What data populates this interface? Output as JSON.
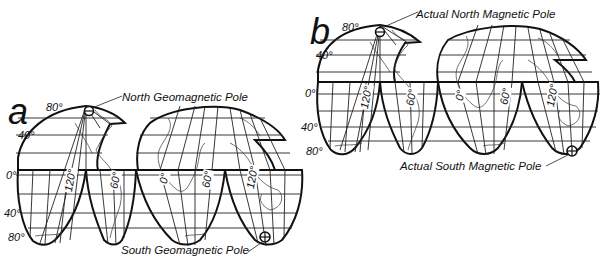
{
  "figure": {
    "projection": "interrupted homolosine world map",
    "panels": [
      {
        "id": "a",
        "letter": "a",
        "latitude_labels": [
          "80°",
          "40°",
          "0°",
          "40°",
          "80°"
        ],
        "longitude_labels": [
          "120°",
          "60°",
          "0°",
          "60°",
          "120°"
        ],
        "north_pole_label": "North Geomagnetic Pole",
        "south_pole_label": "South Geomagnetic Pole"
      },
      {
        "id": "b",
        "letter": "b",
        "latitude_labels": [
          "80°",
          "40°",
          "0°",
          "40°",
          "80°"
        ],
        "longitude_labels": [
          "120°",
          "60°",
          "0°",
          "60°",
          "120°"
        ],
        "north_pole_label": "Actual North Magnetic Pole",
        "south_pole_label": "Actual South Magnetic Pole"
      }
    ],
    "pole_icon": "circle-cross",
    "colors": {
      "line": "#111111",
      "background": "#ffffff"
    }
  }
}
